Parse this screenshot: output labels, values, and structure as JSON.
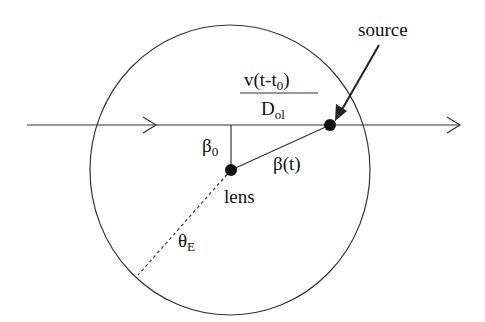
{
  "diagram": {
    "labels": {
      "source": "source",
      "lens": "lens",
      "numerator": "v(t-t",
      "numerator_sub": "0",
      "numerator_close": ")",
      "denominator": "D",
      "denominator_sub": "ol",
      "beta0": "β",
      "beta0_sub": "0",
      "beta_t": "β(t)",
      "theta": "θ",
      "theta_sub": "E"
    },
    "colors": {
      "stroke": "#222222",
      "background": "#ffffff"
    }
  }
}
